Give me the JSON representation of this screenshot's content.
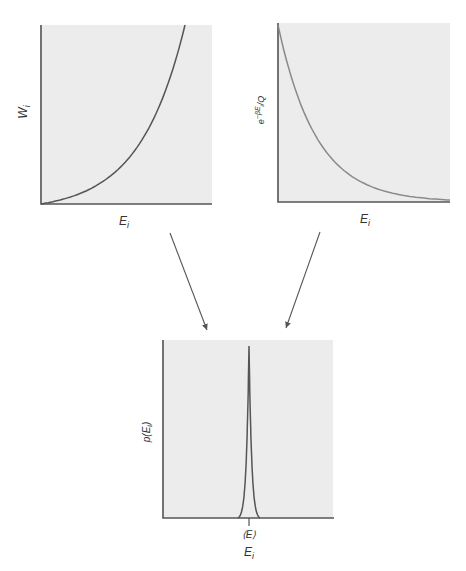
{
  "figure": {
    "panels": {
      "degeneracy": {
        "ylabel_main": "W",
        "ylabel_sub": "i",
        "xlabel_main": "E",
        "xlabel_sub": "i",
        "curve": "increasing-exponential"
      },
      "boltzmann": {
        "ylabel_base": "e",
        "ylabel_exp": "−βE",
        "ylabel_exp_sub": "i",
        "ylabel_tail": "/Q",
        "xlabel_main": "E",
        "xlabel_sub": "i",
        "curve": "decaying-exponential"
      },
      "probability": {
        "ylabel": "p(E",
        "ylabel_sub": "i",
        "ylabel_close": ")",
        "xlabel_main": "E",
        "xlabel_sub": "i",
        "peak_label": "⟨E⟩",
        "curve": "sharp-peak"
      }
    },
    "arrows": [
      {
        "from": "degeneracy",
        "to": "probability"
      },
      {
        "from": "boltzmann",
        "to": "probability"
      }
    ]
  }
}
